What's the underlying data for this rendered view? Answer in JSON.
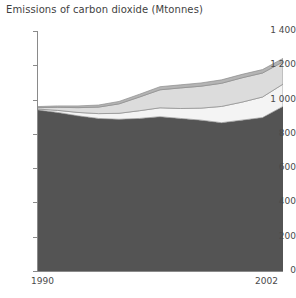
{
  "chart": {
    "title": "Emissions of carbon dioxide (Mtonnes)",
    "x_start_label": "1990",
    "x_end_label": "2002",
    "y_labels": [
      "1 400",
      "1 200",
      "1 000",
      "800",
      "600",
      "400",
      "200",
      "0"
    ]
  },
  "chart_data": {
    "type": "area",
    "title": "Emissions of carbon dioxide (Mtonnes)",
    "xlabel": "",
    "ylabel": "",
    "stacked": true,
    "grid": false,
    "legend": "none",
    "x": [
      1990,
      1991,
      1992,
      1993,
      1994,
      1995,
      1996,
      1997,
      1998,
      1999,
      2000,
      2001,
      2002
    ],
    "xlim": [
      1990,
      2002
    ],
    "ylim": [
      0,
      1400
    ],
    "yticks": [
      0,
      200,
      400,
      600,
      800,
      1000,
      1200,
      1400
    ],
    "ytick_labels": [
      "0",
      "200",
      "400",
      "600",
      "800",
      "1 000",
      "1 200",
      "1 400"
    ],
    "series": [
      {
        "name": "layer-1-base",
        "color": "#545454",
        "values": [
          940,
          925,
          905,
          890,
          885,
          890,
          900,
          890,
          880,
          865,
          880,
          895,
          960
        ]
      },
      {
        "name": "layer-2-light",
        "color": "#f4f4f4",
        "values": [
          5,
          12,
          20,
          28,
          35,
          45,
          52,
          58,
          70,
          95,
          105,
          120,
          130
        ]
      },
      {
        "name": "layer-3-midlight",
        "color": "#dcdcdc",
        "values": [
          8,
          18,
          28,
          38,
          55,
          80,
          105,
          120,
          128,
          135,
          142,
          140,
          130
        ]
      },
      {
        "name": "layer-4-top",
        "color": "#b4b4b4",
        "values": [
          6,
          8,
          10,
          12,
          14,
          16,
          18,
          18,
          19,
          20,
          20,
          20,
          20
        ]
      }
    ],
    "totals": [
      959,
      963,
      963,
      968,
      989,
      1031,
      1075,
      1086,
      1097,
      1115,
      1147,
      1175,
      1240
    ]
  }
}
